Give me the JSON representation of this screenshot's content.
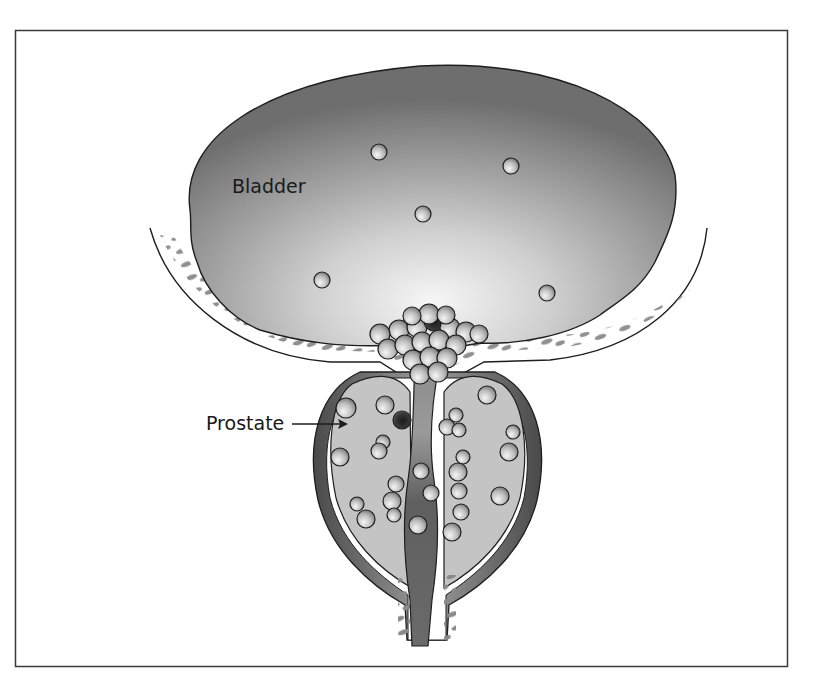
{
  "figure": {
    "frame_color": "#3a3a3a",
    "background": "#ffffff"
  },
  "labels": {
    "bladder": "Bladder",
    "prostate": "Prostate"
  },
  "colors": {
    "bladder_dark": "#6e6e6e",
    "bladder_light": "#f4f4f4",
    "tissue_fleck": "#8a8a8a",
    "prostate_fill": "#c4c4c4",
    "capsule_dark": "#5a5a5a",
    "urethra": "#707070",
    "stone_light": "#f2f2f2",
    "stone_dark": "#7a7a7a",
    "outline": "#1e1e1e"
  },
  "bladder_stones": [
    {
      "x": 379,
      "y": 152,
      "r": 8
    },
    {
      "x": 511,
      "y": 166,
      "r": 8
    },
    {
      "x": 423,
      "y": 214,
      "r": 8
    },
    {
      "x": 322,
      "y": 280,
      "r": 8
    },
    {
      "x": 547,
      "y": 293,
      "r": 8
    }
  ],
  "prostate_stones": [
    {
      "x": 346,
      "y": 408,
      "r": 10
    },
    {
      "x": 385,
      "y": 405,
      "r": 9
    },
    {
      "x": 402,
      "y": 420,
      "r": 9,
      "dark": true
    },
    {
      "x": 383,
      "y": 442,
      "r": 7
    },
    {
      "x": 379,
      "y": 451,
      "r": 8
    },
    {
      "x": 340,
      "y": 457,
      "r": 9
    },
    {
      "x": 396,
      "y": 484,
      "r": 8
    },
    {
      "x": 392,
      "y": 501,
      "r": 9
    },
    {
      "x": 394,
      "y": 515,
      "r": 7
    },
    {
      "x": 357,
      "y": 504,
      "r": 7
    },
    {
      "x": 366,
      "y": 519,
      "r": 9
    },
    {
      "x": 421,
      "y": 471,
      "r": 8
    },
    {
      "x": 431,
      "y": 493,
      "r": 8
    },
    {
      "x": 418,
      "y": 525,
      "r": 9
    },
    {
      "x": 487,
      "y": 395,
      "r": 9
    },
    {
      "x": 456,
      "y": 415,
      "r": 7
    },
    {
      "x": 447,
      "y": 427,
      "r": 8
    },
    {
      "x": 459,
      "y": 430,
      "r": 7
    },
    {
      "x": 513,
      "y": 432,
      "r": 7
    },
    {
      "x": 509,
      "y": 452,
      "r": 9
    },
    {
      "x": 463,
      "y": 457,
      "r": 7
    },
    {
      "x": 458,
      "y": 472,
      "r": 9
    },
    {
      "x": 459,
      "y": 491,
      "r": 8
    },
    {
      "x": 461,
      "y": 512,
      "r": 8
    },
    {
      "x": 500,
      "y": 496,
      "r": 9
    },
    {
      "x": 452,
      "y": 532,
      "r": 9
    }
  ],
  "neck_cluster": [
    {
      "x": 399,
      "y": 330,
      "r": 10
    },
    {
      "x": 417,
      "y": 327,
      "r": 10
    },
    {
      "x": 434,
      "y": 321,
      "r": 10,
      "dark": true
    },
    {
      "x": 450,
      "y": 328,
      "r": 10
    },
    {
      "x": 466,
      "y": 332,
      "r": 10
    },
    {
      "x": 380,
      "y": 334,
      "r": 10
    },
    {
      "x": 388,
      "y": 349,
      "r": 10
    },
    {
      "x": 405,
      "y": 345,
      "r": 10
    },
    {
      "x": 422,
      "y": 342,
      "r": 10
    },
    {
      "x": 439,
      "y": 340,
      "r": 10
    },
    {
      "x": 456,
      "y": 345,
      "r": 10
    },
    {
      "x": 479,
      "y": 334,
      "r": 9
    },
    {
      "x": 413,
      "y": 360,
      "r": 10
    },
    {
      "x": 430,
      "y": 357,
      "r": 10
    },
    {
      "x": 447,
      "y": 358,
      "r": 10
    },
    {
      "x": 420,
      "y": 374,
      "r": 10
    },
    {
      "x": 438,
      "y": 372,
      "r": 10
    },
    {
      "x": 429,
      "y": 314,
      "r": 10
    },
    {
      "x": 412,
      "y": 316,
      "r": 9
    },
    {
      "x": 446,
      "y": 315,
      "r": 9
    }
  ]
}
